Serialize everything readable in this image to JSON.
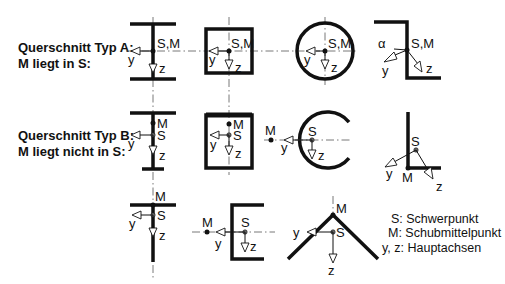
{
  "labels": {
    "type_a_line1": "Querschnitt Typ A:",
    "type_a_line2": "M liegt in S:",
    "type_b_line1": "Querschnitt Typ B:",
    "type_b_line2": "M liegt nicht in S:"
  },
  "legend": {
    "s": "S: Schwerpunkt",
    "m": "M: Schubmittelpunkt",
    "yz": "y, z: Hauptachsen"
  },
  "symbols": {
    "sm": "S,M",
    "s": "S",
    "m": "M",
    "y": "y",
    "z": "z",
    "alpha": "α"
  },
  "figures": {
    "row_a": [
      "I-profile",
      "box",
      "circular-tube",
      "Z-profile"
    ],
    "row_b": [
      "I-profile-unsymmetric",
      "box-thick-top",
      "open-circular",
      "L-angle"
    ],
    "row_c": [
      "T-profile",
      "channel",
      "V-angle"
    ]
  }
}
